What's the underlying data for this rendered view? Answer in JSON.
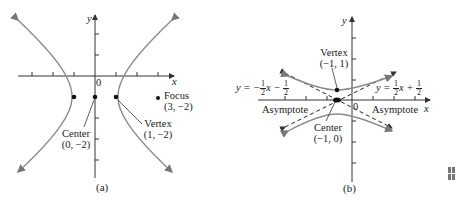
{
  "figure_a": {
    "caption": "(a)",
    "axis_x": "x",
    "axis_y": "y",
    "origin": "0",
    "center": {
      "label": "Center",
      "coords": "(0, −2)"
    },
    "vertex": {
      "label": "Vertex",
      "coords": "(1, −2)"
    },
    "focus": {
      "label": "Focus",
      "coords": "(3, −2)"
    }
  },
  "figure_b": {
    "caption": "(b)",
    "axis_x": "x",
    "axis_y": "y",
    "origin": "0",
    "vertex": {
      "label": "Vertex",
      "coords": "(−1, 1)"
    },
    "center": {
      "label": "Center",
      "coords": "(−1, 0)"
    },
    "asymptote_left": {
      "label": "Asymptote",
      "eq_prefix": "y = −",
      "num": "1",
      "den": "2",
      "eq_mid": "x − ",
      "num2": "1",
      "den2": "2"
    },
    "asymptote_right": {
      "label": "Asymptote",
      "eq_prefix": "y = ",
      "num": "1",
      "den": "2",
      "eq_mid": "x + ",
      "num2": "1",
      "den2": "2"
    }
  },
  "colors": {
    "curve": "#8a8a8a",
    "axis": "#333333",
    "point": "#111111"
  }
}
